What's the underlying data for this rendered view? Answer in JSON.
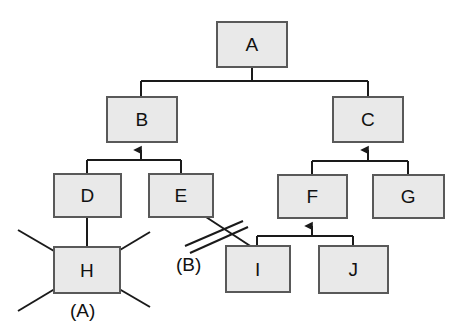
{
  "diagram": {
    "type": "tree-hierarchy-with-annotations",
    "background_color": "#ffffff",
    "node_fill_color": "#e9e9e9",
    "node_border_color": "#595959",
    "line_color": "#1a1a1a",
    "nodes": [
      {
        "id": "A",
        "label": "A",
        "x": 216,
        "y": 21,
        "w": 72,
        "h": 47
      },
      {
        "id": "B",
        "label": "B",
        "x": 106,
        "y": 96,
        "w": 72,
        "h": 47
      },
      {
        "id": "C",
        "label": "C",
        "x": 332,
        "y": 96,
        "w": 72,
        "h": 47
      },
      {
        "id": "D",
        "label": "D",
        "x": 53,
        "y": 173,
        "w": 69,
        "h": 45
      },
      {
        "id": "E",
        "label": "E",
        "x": 148,
        "y": 173,
        "w": 66,
        "h": 45
      },
      {
        "id": "F",
        "label": "F",
        "x": 277,
        "y": 174,
        "w": 71,
        "h": 45
      },
      {
        "id": "G",
        "label": "G",
        "x": 372,
        "y": 174,
        "w": 73,
        "h": 45
      },
      {
        "id": "H",
        "label": "H",
        "x": 53,
        "y": 246,
        "w": 68,
        "h": 48
      },
      {
        "id": "I",
        "label": "I",
        "x": 225,
        "y": 245,
        "w": 66,
        "h": 48
      },
      {
        "id": "J",
        "label": "J",
        "x": 318,
        "y": 245,
        "w": 71,
        "h": 49
      }
    ],
    "edges": [
      {
        "id": "a-to-b",
        "from": "B",
        "to": "A",
        "arrow": "none"
      },
      {
        "id": "a-to-c",
        "from": "C",
        "to": "A",
        "arrow": "none"
      },
      {
        "id": "d-to-b",
        "from": "D",
        "to": "B",
        "arrow": "up"
      },
      {
        "id": "e-to-b",
        "from": "E",
        "to": "B",
        "arrow": "up"
      },
      {
        "id": "f-to-c",
        "from": "F",
        "to": "C",
        "arrow": "up"
      },
      {
        "id": "g-to-c",
        "from": "G",
        "to": "C",
        "arrow": "up"
      },
      {
        "id": "i-to-f",
        "from": "I",
        "to": "F",
        "arrow": "up"
      },
      {
        "id": "j-to-f",
        "from": "J",
        "to": "F",
        "arrow": "up"
      },
      {
        "id": "h-to-d",
        "from": "H",
        "to": "D",
        "arrow": "none"
      },
      {
        "id": "e-to-i",
        "from": "E",
        "to": "I",
        "arrow": "none",
        "state": "cut"
      }
    ],
    "annotations": [
      {
        "id": "annotation-a",
        "label": "(A)",
        "mark": "x-cross-out",
        "target": "H",
        "x": 70,
        "y": 301
      },
      {
        "id": "annotation-b",
        "label": "(B)",
        "mark": "double-slash-cut",
        "target": "e-to-i",
        "x": 176,
        "y": 255
      }
    ]
  }
}
